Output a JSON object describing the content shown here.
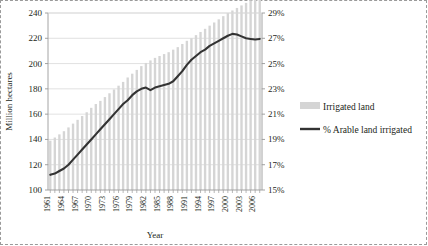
{
  "chart_data": {
    "type": "bar",
    "title": "",
    "xlabel": "Year",
    "ylabel": "Million hectares",
    "y2label": "",
    "ylim": [
      100,
      240
    ],
    "y2lim": [
      15,
      29
    ],
    "grid": true,
    "legend_position": "right",
    "y_ticks": [
      "100",
      "120",
      "140",
      "160",
      "180",
      "200",
      "220",
      "240"
    ],
    "y2_ticks": [
      "15%",
      "17%",
      "19%",
      "21%",
      "23%",
      "25%",
      "27%",
      "29%"
    ],
    "x": [
      1961,
      1962,
      1963,
      1964,
      1965,
      1966,
      1967,
      1968,
      1969,
      1970,
      1971,
      1972,
      1973,
      1974,
      1975,
      1976,
      1977,
      1978,
      1979,
      1980,
      1981,
      1982,
      1983,
      1984,
      1985,
      1986,
      1987,
      1988,
      1989,
      1990,
      1991,
      1992,
      1993,
      1994,
      1995,
      1996,
      1997,
      1998,
      1999,
      2000,
      2001,
      2002,
      2003,
      2004,
      2005,
      2006,
      2007
    ],
    "x_tick_labels": [
      "1961",
      "1964",
      "1967",
      "1970",
      "1973",
      "1976",
      "1979",
      "1982",
      "1985",
      "1988",
      "1991",
      "1994",
      "1997",
      "2000",
      "2003",
      "2006"
    ],
    "x_tick_step": 3,
    "series": [
      {
        "name": "Irrigated land",
        "type": "bar",
        "axis": "left",
        "unit": "million hectares",
        "color": "#d5d5d5",
        "values": [
          139.0,
          141.5,
          144.0,
          146.5,
          149.5,
          152.5,
          155.5,
          158.5,
          161.5,
          165.0,
          168.0,
          170.5,
          173.5,
          176.5,
          179.5,
          182.5,
          185.5,
          189.0,
          192.0,
          195.0,
          198.0,
          200.5,
          202.5,
          204.5,
          206.0,
          207.5,
          209.0,
          211.0,
          213.0,
          215.5,
          218.0,
          220.0,
          222.5,
          225.0,
          227.5,
          230.0,
          232.5,
          235.0,
          237.5,
          240.0,
          242.0,
          244.0,
          246.0,
          248.0,
          250.0,
          252.0,
          253.5
        ]
      },
      {
        "name": "% Arable land irrigated",
        "type": "line",
        "axis": "right",
        "unit": "percent",
        "color": "#333333",
        "values": [
          16.2,
          16.3,
          16.5,
          16.7,
          17.0,
          17.4,
          17.8,
          18.2,
          18.6,
          19.0,
          19.4,
          19.8,
          20.2,
          20.6,
          21.0,
          21.4,
          21.8,
          22.1,
          22.5,
          22.8,
          23.0,
          23.1,
          22.9,
          23.1,
          23.2,
          23.3,
          23.4,
          23.6,
          24.0,
          24.4,
          24.9,
          25.3,
          25.6,
          25.9,
          26.1,
          26.4,
          26.6,
          26.8,
          27.0,
          27.2,
          27.35,
          27.3,
          27.15,
          27.0,
          26.95,
          26.9,
          26.95
        ]
      }
    ]
  },
  "legend": {
    "items": [
      {
        "label": "Irrigated land",
        "marker": "bar",
        "color": "#d5d5d5"
      },
      {
        "label": "% Arable land irrigated",
        "marker": "line",
        "color": "#333333"
      }
    ]
  }
}
